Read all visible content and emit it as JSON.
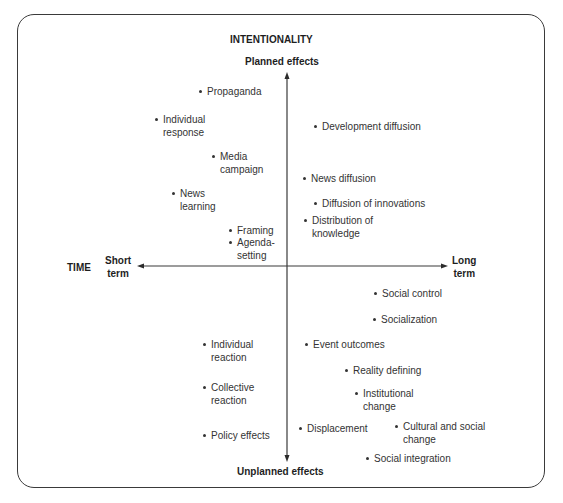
{
  "title": "INTENTIONALITY",
  "axes": {
    "vertical": {
      "top_label": "Planned effects",
      "bottom_label": "Unplanned effects"
    },
    "horizontal": {
      "name": "TIME",
      "left_label_line1": "Short",
      "left_label_line2": "term",
      "right_label_line1": "Long",
      "right_label_line2": "term"
    }
  },
  "items": {
    "propaganda": {
      "line1": "Propaganda"
    },
    "individual_response": {
      "line1": "Individual",
      "line2": "response"
    },
    "media_campaign": {
      "line1": "Media",
      "line2": "campaign"
    },
    "news_learning": {
      "line1": "News",
      "line2": "learning"
    },
    "framing": {
      "line1": "Framing"
    },
    "agenda_setting": {
      "line1": "Agenda-",
      "line2": "setting"
    },
    "development_diffusion": {
      "line1": "Development diffusion"
    },
    "news_diffusion": {
      "line1": "News diffusion"
    },
    "diffusion_of_innovations": {
      "line1": "Diffusion of innovations"
    },
    "distribution_of_knowledge": {
      "line1": "Distribution of",
      "line2": "knowledge"
    },
    "social_control": {
      "line1": "Social control"
    },
    "socialization": {
      "line1": "Socialization"
    },
    "individual_reaction": {
      "line1": "Individual",
      "line2": "reaction"
    },
    "collective_reaction": {
      "line1": "Collective",
      "line2": "reaction"
    },
    "policy_effects": {
      "line1": "Policy effects"
    },
    "event_outcomes": {
      "line1": "Event outcomes"
    },
    "reality_defining": {
      "line1": "Reality defining"
    },
    "institutional_change": {
      "line1": "Institutional",
      "line2": "change"
    },
    "displacement": {
      "line1": "Displacement"
    },
    "cultural_and_social_change": {
      "line1": "Cultural and social",
      "line2": "change"
    },
    "social_integration": {
      "line1": "Social integration"
    }
  },
  "colors": {
    "border": "#3a3a3a",
    "axis": "#3a3a3a",
    "text": "#333333"
  }
}
